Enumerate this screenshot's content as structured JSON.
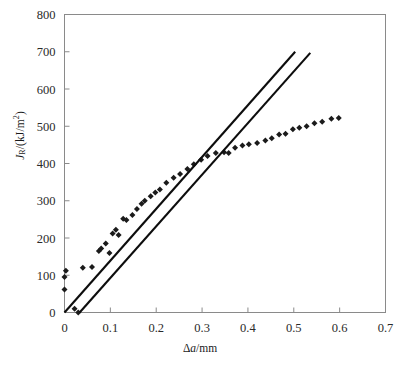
{
  "figure": {
    "background": "#ffffff",
    "axis_color": "#8a8a8a",
    "marker_color": "#1b1b1b",
    "line_color": "#0d0d0d"
  },
  "axis_labels": {
    "y_main": "J",
    "y_sub": "R",
    "y_rest": "/(kJ/m",
    "y_sup": "2",
    "y_close": ")",
    "x_delta": "Δ",
    "x_a": "a",
    "x_unit": "/mm"
  },
  "chart_data": {
    "type": "scatter",
    "title": "",
    "xlabel": "Δa/mm",
    "ylabel": "J_R/(kJ/m2)",
    "xlim": [
      0,
      0.7
    ],
    "ylim": [
      0,
      800
    ],
    "xticks": [
      0,
      0.1,
      0.2,
      0.3,
      0.4,
      0.5,
      0.6,
      0.7
    ],
    "xticklabels": [
      "0",
      "0.1",
      "0.2",
      "0.3",
      "0.4",
      "0.5",
      "0.6",
      "0.7"
    ],
    "yticks": [
      0,
      100,
      200,
      300,
      400,
      500,
      600,
      700,
      800
    ],
    "yticklabels": [
      "0",
      "100",
      "200",
      "300",
      "400",
      "500",
      "600",
      "700",
      "800"
    ],
    "grid": false,
    "legend": null,
    "series": [
      {
        "name": "J-R resistance data",
        "type": "scatter",
        "marker": "diamond",
        "color": "#1b1b1b",
        "points": [
          [
            0.0,
            62
          ],
          [
            0.0,
            95
          ],
          [
            0.003,
            112
          ],
          [
            0.022,
            10
          ],
          [
            0.03,
            0
          ],
          [
            0.04,
            120
          ],
          [
            0.06,
            122
          ],
          [
            0.075,
            165
          ],
          [
            0.08,
            172
          ],
          [
            0.09,
            185
          ],
          [
            0.098,
            160
          ],
          [
            0.105,
            212
          ],
          [
            0.112,
            222
          ],
          [
            0.118,
            208
          ],
          [
            0.128,
            252
          ],
          [
            0.135,
            248
          ],
          [
            0.148,
            262
          ],
          [
            0.158,
            278
          ],
          [
            0.168,
            292
          ],
          [
            0.175,
            300
          ],
          [
            0.188,
            312
          ],
          [
            0.198,
            322
          ],
          [
            0.208,
            330
          ],
          [
            0.222,
            348
          ],
          [
            0.238,
            362
          ],
          [
            0.252,
            372
          ],
          [
            0.268,
            385
          ],
          [
            0.282,
            398
          ],
          [
            0.298,
            410
          ],
          [
            0.312,
            420
          ],
          [
            0.33,
            428
          ],
          [
            0.348,
            430
          ],
          [
            0.358,
            428
          ],
          [
            0.372,
            442
          ],
          [
            0.388,
            448
          ],
          [
            0.402,
            452
          ],
          [
            0.42,
            455
          ],
          [
            0.438,
            462
          ],
          [
            0.452,
            468
          ],
          [
            0.468,
            478
          ],
          [
            0.482,
            480
          ],
          [
            0.498,
            492
          ],
          [
            0.512,
            496
          ],
          [
            0.528,
            500
          ],
          [
            0.545,
            508
          ],
          [
            0.562,
            512
          ],
          [
            0.582,
            520
          ],
          [
            0.598,
            522
          ]
        ]
      },
      {
        "name": "construction line 1",
        "type": "line",
        "color": "#0d0d0d",
        "points": [
          [
            0.0,
            0
          ],
          [
            0.503,
            700
          ]
        ]
      },
      {
        "name": "construction line 2",
        "type": "line",
        "color": "#0d0d0d",
        "points": [
          [
            0.033,
            0
          ],
          [
            0.536,
            697
          ]
        ]
      }
    ],
    "annotations": []
  }
}
